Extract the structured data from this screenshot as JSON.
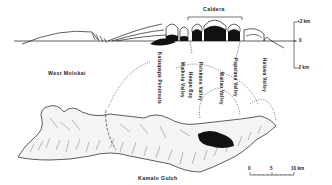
{
  "cross_section": {
    "caldera_label": "Caldera",
    "scale": {
      "top": "+2 km",
      "zero": "0",
      "bottom": "-2 km"
    }
  },
  "map": {
    "region_labels": {
      "west": "West Molokai",
      "south": "Kamalo Gulch"
    },
    "north_coast_labels": [
      "Kalaupapa Peninsula",
      "Waikolu Valley",
      "Haupu Bay",
      "Pelekunu Valley",
      "Wailau Valley",
      "Papalaua Valley",
      "Halawa Valley"
    ],
    "scale_bar": {
      "tick_0": "0",
      "tick_5": "5",
      "tick_10": "10 km"
    }
  },
  "colors": {
    "ink": "#1a1a1a",
    "fill_black": "#111111",
    "paper": "#ffffff"
  }
}
